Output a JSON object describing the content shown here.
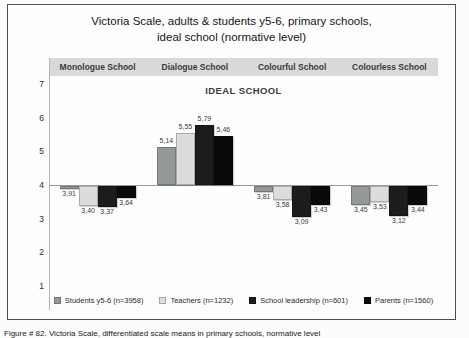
{
  "title": {
    "line1": "Victoria Scale, adults & students y5-6, primary schools,",
    "line2": "ideal school (normative level)"
  },
  "plot_subtitle": "IDEAL SCHOOL",
  "caption": "Figure # 82. Victoria Scale, differentiated scale means in primary schools, normative level",
  "chart_data": {
    "type": "bar",
    "title": "Victoria Scale, adults & students y5-6, primary schools, ideal school (normative level)",
    "subtitle": "IDEAL SCHOOL",
    "categories": [
      "Monologue School",
      "Dialogue School",
      "Colourful School",
      "Colourless School"
    ],
    "series": [
      {
        "name": "Students y5-6 (n=3958)",
        "color": "#949a9a",
        "values": [
          3.91,
          5.14,
          3.81,
          3.45
        ],
        "labels": [
          "3,91",
          "5,14",
          "3,81",
          "3,45"
        ]
      },
      {
        "name": "Teachers (n=1232)",
        "color": "#dcdcdc",
        "values": [
          3.4,
          5.55,
          3.58,
          3.53
        ],
        "labels": [
          "3,40",
          "5,55",
          "3,58",
          "3,53"
        ]
      },
      {
        "name": "School leadership (n=601)",
        "color": "#1c1c1c",
        "values": [
          3.37,
          5.79,
          3.09,
          3.12
        ],
        "labels": [
          "3,37",
          "5,79",
          "3,09",
          "3,12"
        ]
      },
      {
        "name": "Parents (n=1560)",
        "color": "#0a0a0a",
        "values": [
          3.64,
          5.46,
          3.43,
          3.44
        ],
        "labels": [
          "3,64",
          "5,46",
          "3,43",
          "3,44"
        ]
      }
    ],
    "y_ticks": [
      7,
      6,
      5,
      4,
      3,
      2,
      1
    ],
    "ylim": [
      1,
      7
    ],
    "axis_crossing": 4,
    "grid": false,
    "legend_position": "bottom",
    "value_label_decimal_separator": ","
  }
}
